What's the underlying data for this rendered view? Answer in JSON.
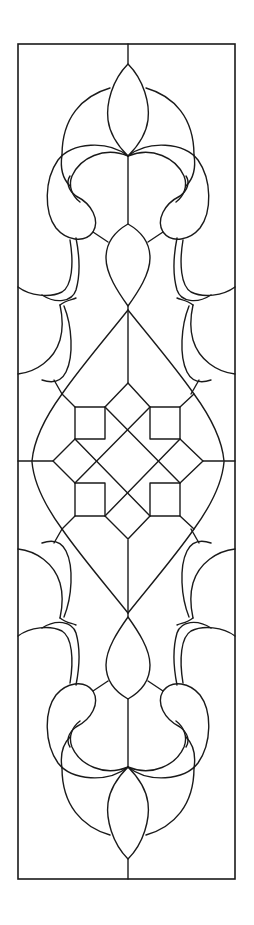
{
  "artwork": {
    "title": "Stained glass panel pattern",
    "style": "line art",
    "symmetry": "bilateral (vertical and horizontal)",
    "colors": {
      "background": "#ffffff",
      "lead_lines": "#1a1a1a"
    },
    "frame": {
      "x": 18,
      "y": 44,
      "width": 217,
      "height": 835
    },
    "motifs": [
      "top lens (teardrop)",
      "upper crown arcs",
      "upper scroll pair",
      "upper side leaves",
      "middle lens",
      "central ogee diamond",
      "square-and-diamond lattice medallion",
      "lower side leaves",
      "lower scroll pair",
      "bottom lens"
    ]
  }
}
